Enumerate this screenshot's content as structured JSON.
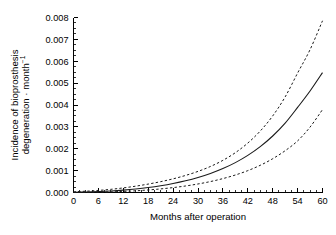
{
  "chart_data": {
    "type": "line",
    "title": "",
    "xlabel": "Months after operation",
    "ylabel_line1": "Incidence of bioprosthesis",
    "ylabel_line2": "degeneration · month",
    "ylabel_exponent": "−1",
    "xlim": [
      0,
      60
    ],
    "ylim": [
      0,
      0.008
    ],
    "xticks": [
      0,
      6,
      12,
      18,
      24,
      30,
      36,
      42,
      48,
      54,
      60
    ],
    "xticklabels": [
      "0",
      "6",
      "12",
      "18",
      "24",
      "30",
      "36",
      "42",
      "48",
      "54",
      "60"
    ],
    "xminor_step": 1.5,
    "yticks": [
      0,
      0.001,
      0.002,
      0.003,
      0.004,
      0.005,
      0.006,
      0.007,
      0.008
    ],
    "yticklabels": [
      "0.000",
      "0.001",
      "0.002",
      "0.003",
      "0.004",
      "0.005",
      "0.006",
      "0.007",
      "0.008"
    ],
    "yminor_step": 0.00025,
    "grid": false,
    "legend": null,
    "x": [
      0,
      3,
      6,
      9,
      12,
      15,
      18,
      21,
      24,
      27,
      30,
      33,
      36,
      39,
      42,
      45,
      48,
      51,
      54,
      57,
      60
    ],
    "series": [
      {
        "name": "Upper 95% confidence limit",
        "style": "dashed",
        "color": "#1a1a1a",
        "values": [
          3.5e-05,
          6e-05,
          9.5e-05,
          0.000145,
          0.00021,
          0.00029,
          0.000385,
          0.000495,
          0.000625,
          0.00078,
          0.000965,
          0.00119,
          0.00147,
          0.00182,
          0.00226,
          0.00281,
          0.0035,
          0.00437,
          0.00546,
          0.00653,
          0.00785
        ]
      },
      {
        "name": "Estimated incidence",
        "style": "solid",
        "color": "#1a1a1a",
        "values": [
          1.2e-05,
          2.2e-05,
          4e-05,
          6.8e-05,
          0.000108,
          0.00016,
          0.000226,
          0.000308,
          0.00041,
          0.000534,
          0.000686,
          0.00087,
          0.001094,
          0.001366,
          0.001696,
          0.002096,
          0.002582,
          0.003172,
          0.00389,
          0.00464,
          0.00548
        ]
      },
      {
        "name": "Lower 95% confidence limit",
        "style": "dashed",
        "color": "#1a1a1a",
        "values": [
          4e-06,
          8e-06,
          1.6e-05,
          2.9e-05,
          5e-05,
          7.8e-05,
          0.000116,
          0.000164,
          0.000224,
          0.000298,
          0.00039,
          0.0005,
          0.000636,
          0.0008,
          0.001,
          0.001244,
          0.001544,
          0.00191,
          0.00236,
          0.00299,
          0.00379
        ]
      }
    ]
  }
}
